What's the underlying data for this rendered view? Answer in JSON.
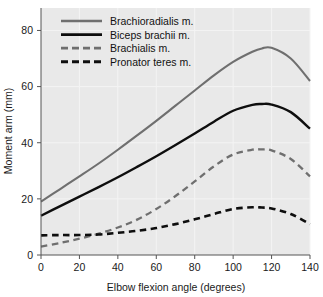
{
  "chart_data": {
    "type": "line",
    "title": "",
    "xlabel": "Elbow flexion angle (degrees)",
    "ylabel": "Moment arm (mm)",
    "xlim": [
      0,
      140
    ],
    "ylim": [
      0,
      88
    ],
    "xticks": [
      0,
      20,
      40,
      60,
      80,
      100,
      120,
      140
    ],
    "yticks": [
      0,
      20,
      40,
      60,
      80
    ],
    "xtick_labels": [
      "0",
      "20",
      "40",
      "60",
      "80",
      "100",
      "120",
      "140"
    ],
    "ytick_labels": [
      "0",
      "20",
      "40",
      "60",
      "80"
    ],
    "grid": true,
    "legend_position": "top-left",
    "x": [
      0,
      10,
      20,
      30,
      40,
      50,
      60,
      70,
      80,
      90,
      100,
      110,
      115,
      120,
      130,
      140
    ],
    "series": [
      {
        "name": "Brachioradialis m.",
        "color": "#6f6f6f",
        "style": "solid",
        "width": 2.1,
        "values": [
          19.0,
          23.5,
          28.0,
          32.6,
          37.5,
          42.6,
          47.8,
          53.2,
          58.6,
          64.0,
          68.8,
          72.4,
          73.6,
          73.8,
          70.0,
          62.0
        ]
      },
      {
        "name": "Biceps brachii m.",
        "color": "#0e0e0e",
        "style": "solid",
        "width": 2.4,
        "values": [
          14.0,
          17.4,
          20.8,
          24.2,
          27.7,
          31.4,
          35.2,
          39.2,
          43.3,
          47.5,
          51.4,
          53.5,
          53.8,
          53.6,
          50.9,
          45.0
        ]
      },
      {
        "name": "Brachialis m.",
        "color": "#6f6f6f",
        "style": "dashed",
        "width": 2.3,
        "values": [
          3.0,
          4.3,
          5.8,
          7.6,
          9.8,
          12.6,
          16.4,
          21.0,
          26.2,
          31.6,
          35.8,
          37.5,
          37.6,
          37.3,
          34.2,
          28.0
        ]
      },
      {
        "name": "Pronator teres m.",
        "color": "#0e0e0e",
        "style": "dashed",
        "width": 2.6,
        "values": [
          7.0,
          7.1,
          7.1,
          7.3,
          7.9,
          8.6,
          9.6,
          11.0,
          12.7,
          14.6,
          16.4,
          17.0,
          16.9,
          16.6,
          14.6,
          11.0
        ]
      }
    ],
    "colors": {
      "plot_background": "#e9e9e9",
      "gridline": "#f4f4f4",
      "axis": "#555555",
      "text": "#1a1a1a"
    }
  }
}
